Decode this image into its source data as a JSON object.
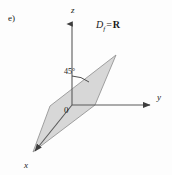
{
  "figure": {
    "item_label": "e)",
    "caption_symbols": {
      "domain_var": "D",
      "domain_subscript": "f",
      "equals": "=",
      "domain_value": "R"
    },
    "axes": {
      "z_label": "z",
      "y_label": "y",
      "x_label": "x",
      "origin_label": "0"
    },
    "angle": {
      "label": "45°",
      "value": 45,
      "unit": "degrees",
      "between": "z-axis and plane edge"
    },
    "colors": {
      "background": "#fdfdfd",
      "axis_stroke": "#5a5a5a",
      "plane_fill": "#d4d4d4",
      "plane_stroke": "#8c8c8c",
      "text": "#1a1a1a"
    },
    "geometry": {
      "origin": [
        72,
        105
      ],
      "z_axis_tip": [
        72,
        22
      ],
      "y_axis_tip": [
        152,
        105
      ],
      "x_axis_tip": [
        33,
        154
      ],
      "plane_vertices": [
        [
          116,
          55
        ],
        [
          95,
          105
        ],
        [
          33,
          152
        ],
        [
          50,
          106
        ]
      ]
    }
  }
}
